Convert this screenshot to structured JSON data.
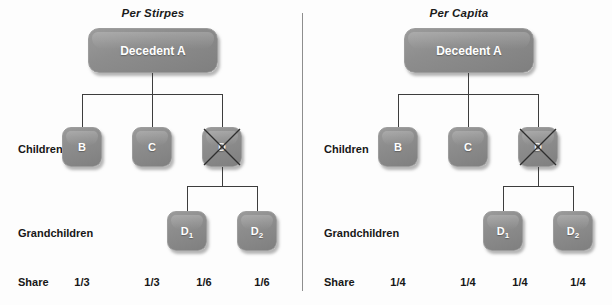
{
  "figure": {
    "panels": [
      {
        "id": "per-stirpes",
        "title": "Per Stirpes",
        "root": {
          "label": "Decedent A"
        },
        "row_labels": {
          "children": "Children",
          "grandchildren": "Grandchildren",
          "share": "Share"
        },
        "children": [
          {
            "id": "b",
            "label": "B",
            "crossed": false,
            "share": "1/3"
          },
          {
            "id": "c",
            "label": "C",
            "crossed": false,
            "share": "1/3"
          },
          {
            "id": "d",
            "label": "D",
            "crossed": true,
            "share": ""
          }
        ],
        "grandchildren": [
          {
            "id": "d1",
            "label": "D",
            "sub": "1",
            "share": "1/6"
          },
          {
            "id": "d2",
            "label": "D",
            "sub": "2",
            "share": "1/6"
          }
        ],
        "shares": [
          "1/3",
          "1/3",
          "1/6",
          "1/6"
        ]
      },
      {
        "id": "per-capita",
        "title": "Per Capita",
        "root": {
          "label": "Decedent A"
        },
        "row_labels": {
          "children": "Children",
          "grandchildren": "Grandchildren",
          "share": "Share"
        },
        "children": [
          {
            "id": "b",
            "label": "B",
            "crossed": false,
            "share": "1/4"
          },
          {
            "id": "c",
            "label": "C",
            "crossed": false,
            "share": "1/4"
          },
          {
            "id": "d",
            "label": "D",
            "crossed": true,
            "share": ""
          }
        ],
        "grandchildren": [
          {
            "id": "d1",
            "label": "D",
            "sub": "1",
            "share": "1/4"
          },
          {
            "id": "d2",
            "label": "D",
            "sub": "2",
            "share": "1/4"
          }
        ],
        "shares": [
          "1/4",
          "1/4",
          "1/4",
          "1/4"
        ]
      }
    ],
    "colors": {
      "node_fill": "#8c8c8c",
      "node_text": "#ffffff",
      "connector": "#3d3d3d",
      "divider": "#8e8e8e",
      "label_text": "#171717",
      "background": "#fdfdfd"
    }
  }
}
